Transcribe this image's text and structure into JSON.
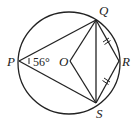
{
  "diagram": {
    "type": "circle-geometry",
    "stroke_color": "#222222",
    "circle": {
      "center": "O",
      "cx": 69,
      "cy": 63,
      "r": 51
    },
    "points": {
      "P": {
        "label": "P",
        "x": 19,
        "y": 61
      },
      "Q": {
        "label": "Q",
        "x": 96,
        "y": 20
      },
      "R": {
        "label": "R",
        "x": 119,
        "y": 61
      },
      "S": {
        "label": "S",
        "x": 96,
        "y": 103
      },
      "O": {
        "label": "O",
        "x": 70,
        "y": 61
      }
    },
    "segments": [
      "PQ",
      "PS",
      "QS",
      "QO",
      "OS",
      "QR",
      "RS"
    ],
    "equal_marks": [
      "QR",
      "RS"
    ],
    "angle_label": {
      "at": "P",
      "text": "56°"
    }
  }
}
